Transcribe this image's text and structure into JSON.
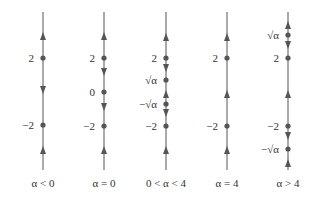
{
  "diagram": {
    "line_color": "#707070",
    "dot_color": "#555555",
    "line_top": 12,
    "line_bottom": 170,
    "columns": [
      {
        "x": 43,
        "caption": "α < 0",
        "points": [
          {
            "type": "arrow-up",
            "y": 36
          },
          {
            "type": "dot",
            "y": 58,
            "label": "2"
          },
          {
            "type": "arrow-down",
            "y": 90
          },
          {
            "type": "dot",
            "y": 125,
            "label": "−2"
          },
          {
            "type": "arrow-up",
            "y": 150
          }
        ]
      },
      {
        "x": 104,
        "caption": "α = 0",
        "points": [
          {
            "type": "arrow-up",
            "y": 36
          },
          {
            "type": "dot",
            "y": 58,
            "label": "2"
          },
          {
            "type": "arrow-down",
            "y": 72
          },
          {
            "type": "dot",
            "y": 92,
            "label": "0"
          },
          {
            "type": "arrow-down",
            "y": 107
          },
          {
            "type": "dot",
            "y": 126,
            "label": "−2"
          },
          {
            "type": "arrow-up",
            "y": 150
          }
        ]
      },
      {
        "x": 166,
        "caption": "0 < α < 4",
        "points": [
          {
            "type": "arrow-up",
            "y": 37
          },
          {
            "type": "dot",
            "y": 58,
            "label": "2"
          },
          {
            "type": "arrow-down",
            "y": 68
          },
          {
            "type": "dot",
            "y": 80,
            "label": "√α"
          },
          {
            "type": "arrow-up",
            "y": 94
          },
          {
            "type": "dot",
            "y": 104,
            "label": "−√α"
          },
          {
            "type": "arrow-down",
            "y": 113
          },
          {
            "type": "dot",
            "y": 126,
            "label": "−2"
          },
          {
            "type": "arrow-up",
            "y": 150
          }
        ]
      },
      {
        "x": 227,
        "caption": "α = 4",
        "points": [
          {
            "type": "arrow-up",
            "y": 37
          },
          {
            "type": "dot",
            "y": 58,
            "label": "2"
          },
          {
            "type": "arrow-up",
            "y": 94
          },
          {
            "type": "dot",
            "y": 126,
            "label": "−2"
          },
          {
            "type": "arrow-up",
            "y": 150
          }
        ]
      },
      {
        "x": 288,
        "caption": "α > 4",
        "points": [
          {
            "type": "arrow-up",
            "y": 25
          },
          {
            "type": "dot",
            "y": 35,
            "label": "√α"
          },
          {
            "type": "arrow-down",
            "y": 45
          },
          {
            "type": "dot",
            "y": 58,
            "label": "2"
          },
          {
            "type": "arrow-up",
            "y": 94
          },
          {
            "type": "dot",
            "y": 126,
            "label": "−2"
          },
          {
            "type": "arrow-down",
            "y": 136
          },
          {
            "type": "dot",
            "y": 149,
            "label": "−√α"
          },
          {
            "type": "arrow-up",
            "y": 163
          }
        ]
      }
    ]
  }
}
